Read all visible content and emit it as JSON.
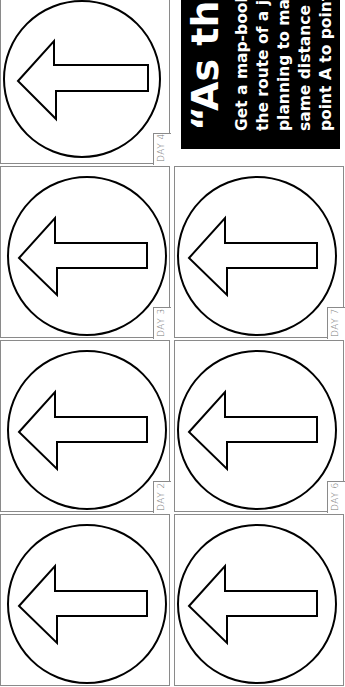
{
  "page": {
    "orientation": "rotated-90-ccw",
    "background": "#ffffff"
  },
  "callout": {
    "title": "“As the c",
    "lines": [
      "Get a map-book",
      "the route of a jou",
      "planning to mak",
      "same distance “",
      "point A to point I"
    ],
    "bg_color": "#000000",
    "text_color": "#ffffff"
  },
  "cards": [
    {
      "label": "DAY 4",
      "icon": "left-arrow-in-circle-icon"
    },
    {
      "label": "DAY 3",
      "icon": "left-arrow-in-circle-icon"
    },
    {
      "label": "DAY 7",
      "icon": "left-arrow-in-circle-icon"
    },
    {
      "label": "DAY 2",
      "icon": "left-arrow-in-circle-icon"
    },
    {
      "label": "DAY 6",
      "icon": "left-arrow-in-circle-icon"
    },
    {
      "label": "",
      "icon": "left-arrow-in-circle-icon"
    },
    {
      "label": "",
      "icon": "left-arrow-in-circle-icon"
    }
  ]
}
